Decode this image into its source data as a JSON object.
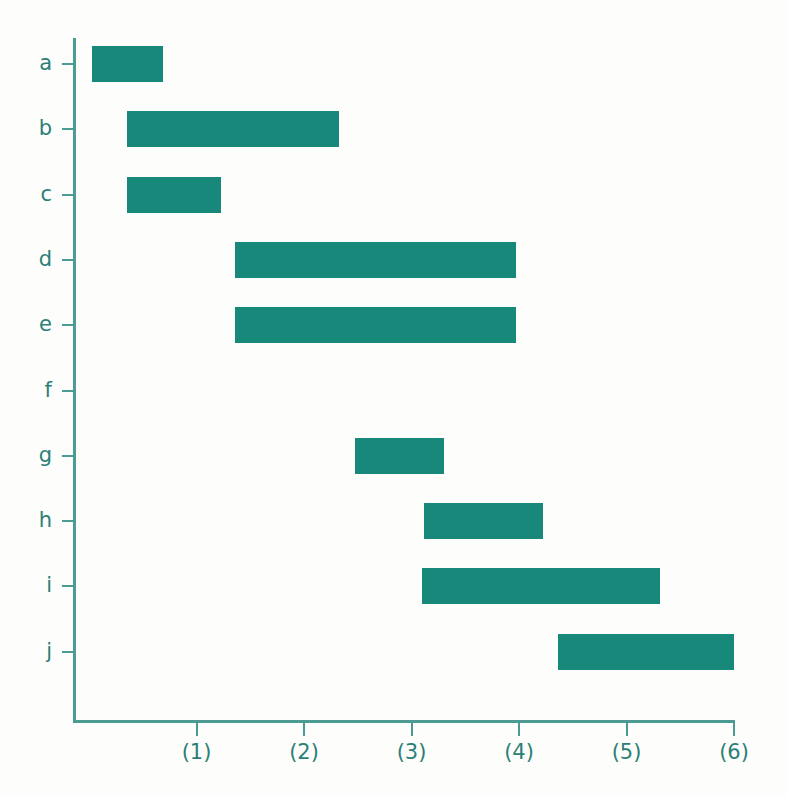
{
  "chart_data": {
    "type": "bar",
    "orientation": "horizontal",
    "subtype": "gantt-range-bar",
    "title": "",
    "subtitle": "",
    "xlabel": "",
    "ylabel": "",
    "categories": [
      "a",
      "b",
      "c",
      "d",
      "e",
      "f",
      "g",
      "h",
      "i",
      "j"
    ],
    "xtick_labels": [
      "(1)",
      "(2)",
      "(3)",
      "(4)",
      "(5)",
      "(6)"
    ],
    "xticks": [
      1,
      2,
      3,
      4,
      5,
      6
    ],
    "xlim": [
      0,
      6.1
    ],
    "grid": false,
    "legend": null,
    "bar_color": "#17887a",
    "axis_color": "#4c9b93",
    "label_color": "#2b7f77",
    "background_color": "#fdfdfb",
    "bars": [
      {
        "category": "a",
        "start": 0.03,
        "end": 0.69,
        "duration": 0.66
      },
      {
        "category": "b",
        "start": 0.35,
        "end": 2.33,
        "duration": 1.98
      },
      {
        "category": "c",
        "start": 0.35,
        "end": 1.23,
        "duration": 0.88
      },
      {
        "category": "d",
        "start": 1.36,
        "end": 3.97,
        "duration": 2.61
      },
      {
        "category": "e",
        "start": 1.36,
        "end": 3.97,
        "duration": 2.61
      },
      {
        "category": "f",
        "start": null,
        "end": null,
        "duration": 0
      },
      {
        "category": "g",
        "start": 2.47,
        "end": 3.3,
        "duration": 0.83
      },
      {
        "category": "h",
        "start": 3.12,
        "end": 4.22,
        "duration": 1.1
      },
      {
        "category": "i",
        "start": 3.1,
        "end": 5.31,
        "duration": 2.21
      },
      {
        "category": "j",
        "start": 4.36,
        "end": 6.0,
        "duration": 1.64
      }
    ]
  },
  "axis": {
    "y_tick_labels": [
      "a",
      "b",
      "c",
      "d",
      "e",
      "f",
      "g",
      "h",
      "i",
      "j"
    ],
    "x_tick_labels": [
      "(1)",
      "(2)",
      "(3)",
      "(4)",
      "(5)",
      "(6)"
    ]
  }
}
